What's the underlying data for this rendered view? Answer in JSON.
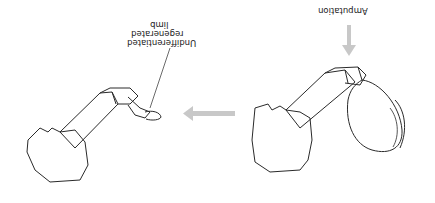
{
  "figure": {
    "orientation": "rotated-180",
    "labels": {
      "amputation": "Amputation",
      "undifferentiated_line1": "Undifferentiated",
      "undifferentiated_line2": "regenerated",
      "undifferentiated_line3": "limb"
    },
    "colors": {
      "outline": "#2a2a2a",
      "arrow": "#c8c8c8",
      "background": "#ffffff"
    },
    "panels": [
      {
        "name": "intact-claw-limb",
        "position": "right"
      },
      {
        "name": "regenerated-limb",
        "position": "left"
      }
    ]
  }
}
